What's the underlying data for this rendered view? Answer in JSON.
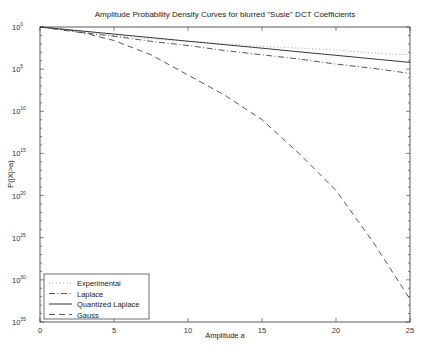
{
  "chart_data": {
    "type": "line",
    "title": "Amplitude Probability Density Curves for blurred \"Susie\" DCT Coefficients",
    "xlabel": "Amplitude a",
    "ylabel": "P(|X|>a)",
    "xlim": [
      0,
      25
    ],
    "ylim_log10": [
      -35,
      0
    ],
    "yscale": "log",
    "grid": false,
    "legend_position": "lower left",
    "x_ticks": [
      0,
      5,
      10,
      15,
      20,
      25
    ],
    "y_ticks": [
      {
        "base": "10",
        "exp": "0",
        "log10": 0
      },
      {
        "base": "10",
        "exp": "5",
        "log10": -5
      },
      {
        "base": "10",
        "exp": "10",
        "log10": -10
      },
      {
        "base": "10",
        "exp": "15",
        "log10": -15
      },
      {
        "base": "10",
        "exp": "20",
        "log10": -20
      },
      {
        "base": "10",
        "exp": "25",
        "log10": -25
      },
      {
        "base": "10",
        "exp": "30",
        "log10": -30
      },
      {
        "base": "10",
        "exp": "35",
        "log10": -35
      }
    ],
    "x": [
      0,
      2.5,
      5,
      7.5,
      10,
      12.5,
      15,
      17.5,
      20,
      22.5,
      25
    ],
    "series": [
      {
        "name": "Experimental",
        "style": "dotted",
        "color": "#999999",
        "log10_values": [
          0,
          -0.5,
          -1.0,
          -1.4,
          -1.7,
          -2.0,
          -2.3,
          -2.5,
          -2.7,
          -3.1,
          -3.3
        ]
      },
      {
        "name": "Laplace",
        "style": "dashdot",
        "color": "#444444",
        "log10_values": [
          0,
          -0.6,
          -1.1,
          -1.7,
          -2.2,
          -2.8,
          -3.3,
          -3.8,
          -4.4,
          -4.9,
          -5.5
        ]
      },
      {
        "name": "Quantized Laplace",
        "style": "solid",
        "color": "#222222",
        "log10_values": [
          0,
          -0.42,
          -0.84,
          -1.26,
          -1.68,
          -2.1,
          -2.52,
          -2.94,
          -3.36,
          -3.78,
          -4.2
        ]
      },
      {
        "name": "Gauss",
        "style": "dashed",
        "color": "#444444",
        "log10_values": [
          0,
          -0.5,
          -1.6,
          -3.3,
          -5.7,
          -8.1,
          -11.0,
          -15.0,
          -19.4,
          -25.5,
          -32.3
        ]
      }
    ]
  }
}
